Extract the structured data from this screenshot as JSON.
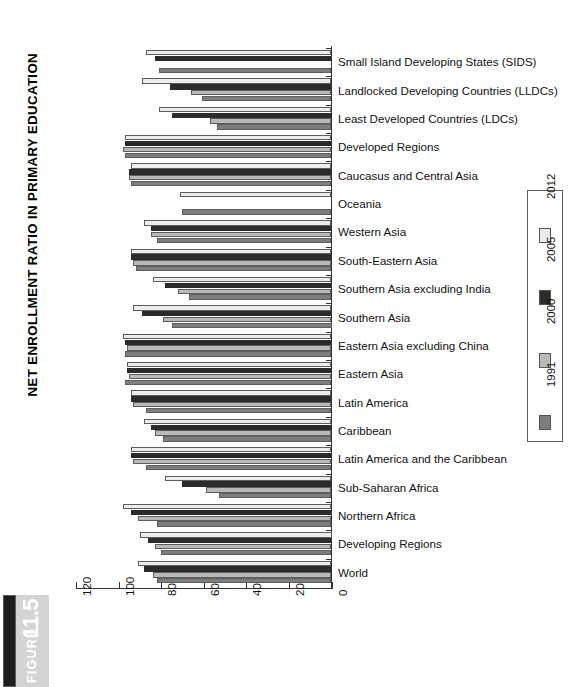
{
  "figure": {
    "label": "FIGURE",
    "number": "11.5",
    "title": "NET ENROLLMENT RATIO IN PRIMARY EDUCATION"
  },
  "legend": {
    "position": "right",
    "entries": [
      {
        "label": "2012",
        "color": "#ececec"
      },
      {
        "label": "2005",
        "color": "#2b2b2b"
      },
      {
        "label": "2000",
        "color": "#b9b9b9"
      },
      {
        "label": "1991",
        "color": "#7d7d7d"
      }
    ]
  },
  "axis": {
    "x_ticks": [
      "120",
      "100",
      "80",
      "60",
      "40",
      "20",
      "0"
    ],
    "x_min": 0,
    "x_max": 120,
    "reversed": true
  },
  "chart_data": {
    "type": "bar",
    "orientation": "horizontal",
    "title": "NET ENROLLMENT RATIO IN PRIMARY EDUCATION",
    "xlabel": "",
    "ylabel": "",
    "xlim": [
      0,
      120
    ],
    "grid": false,
    "legend_position": "right",
    "x_direction": "right-to-left",
    "categories": [
      "Small Island Developing States (SIDS)",
      "Landlocked Developing Countries (LLDCs)",
      "Least Developed Countries (LDCs)",
      "Developed Regions",
      "Caucasus and Central Asia",
      "Oceania",
      "Western Asia",
      "South-Eastern Asia",
      "Southern Asia excluding India",
      "Southern Asia",
      "Eastern Asia excluding China",
      "Eastern Asia",
      "Latin America",
      "Caribbean",
      "Latin America and the Caribbean",
      "Sub-Saharan Africa",
      "Northern Africa",
      "Developing Regions",
      "World"
    ],
    "series": [
      {
        "name": "2012",
        "color": "#ececec",
        "values": [
          87,
          89,
          81,
          97,
          94,
          71,
          88,
          94,
          84,
          93,
          98,
          96,
          94,
          88,
          94,
          78,
          98,
          90,
          91
        ]
      },
      {
        "name": "2005",
        "color": "#2b2b2b",
        "values": [
          83,
          76,
          75,
          97,
          95,
          null,
          85,
          94,
          78,
          89,
          97,
          96,
          94,
          85,
          94,
          70,
          94,
          86,
          88
        ]
      },
      {
        "name": "2000",
        "color": "#b9b9b9",
        "values": [
          null,
          66,
          57,
          98,
          95,
          null,
          85,
          93,
          72,
          79,
          96,
          95,
          93,
          83,
          93,
          59,
          91,
          83,
          84
        ]
      },
      {
        "name": "1991",
        "color": "#7d7d7d",
        "values": [
          81,
          61,
          54,
          97,
          94,
          70,
          82,
          92,
          67,
          75,
          97,
          97,
          87,
          79,
          87,
          53,
          82,
          80,
          82
        ]
      }
    ]
  }
}
